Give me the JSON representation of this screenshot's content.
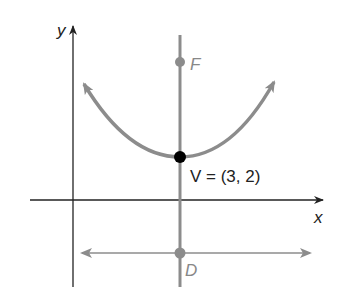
{
  "diagram": {
    "type": "parabola-focus-directrix",
    "axes": {
      "x_label": "x",
      "y_label": "y"
    },
    "vertex": {
      "label": "V = (3, 2)",
      "x": 3,
      "y": 2
    },
    "focus": {
      "label": "F"
    },
    "directrix_point": {
      "label": "D"
    },
    "colors": {
      "axes": "#222222",
      "curve": "#8c8c8c",
      "axis_of_symmetry": "#8c8c8c",
      "directrix": "#8c8c8c",
      "vertex": "#000000",
      "points": "#8c8c8c"
    }
  }
}
